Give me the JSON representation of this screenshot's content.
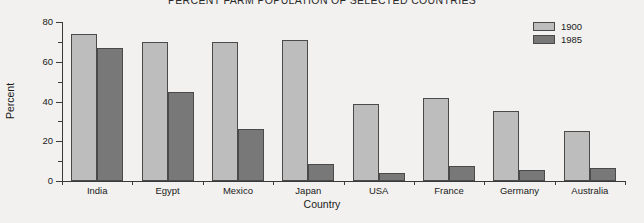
{
  "chart_data": {
    "type": "bar",
    "title": "PERCENT FARM POPULATION OF SELECTED COUNTRIES",
    "xlabel": "Country",
    "ylabel": "Percent",
    "categories": [
      "India",
      "Egypt",
      "Mexico",
      "Japan",
      "USA",
      "France",
      "Germany",
      "Australia"
    ],
    "series": [
      {
        "name": "1900",
        "color": "#bdbdbd",
        "values": [
          74,
          70,
          70,
          71,
          38.5,
          42,
          35,
          25
        ]
      },
      {
        "name": "1985",
        "color": "#787878",
        "values": [
          67,
          45,
          26,
          8.5,
          4,
          7.5,
          5.5,
          6.5
        ]
      }
    ],
    "ylim": [
      0,
      80
    ],
    "yticks": [
      0,
      20,
      40,
      60,
      80
    ],
    "ytick_labels": [
      "0",
      "20",
      "40",
      "60",
      "80"
    ],
    "yminor_ticks": [
      10,
      30,
      50,
      70
    ],
    "grid": false,
    "legend_position": "top-right"
  }
}
